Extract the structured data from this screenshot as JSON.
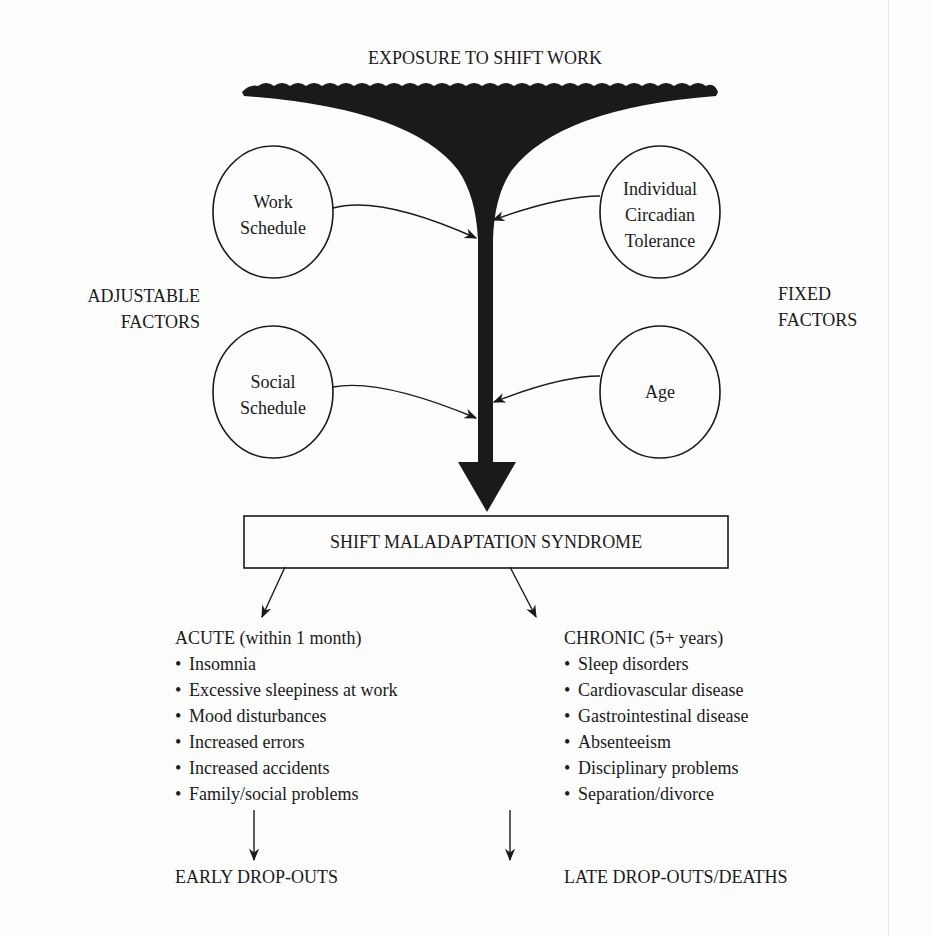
{
  "title": "EXPOSURE TO SHIFT WORK",
  "side_labels": {
    "adjustable": [
      "ADJUSTABLE",
      "FACTORS"
    ],
    "fixed": [
      "FIXED",
      "FACTORS"
    ]
  },
  "factors": {
    "work_schedule": [
      "Work",
      "Schedule"
    ],
    "social_schedule": [
      "Social",
      "Schedule"
    ],
    "circadian_tolerance": [
      "Individual",
      "Circadian",
      "Tolerance"
    ],
    "age": [
      "Age"
    ]
  },
  "syndrome_box": "SHIFT MALADAPTATION SYNDROME",
  "acute": {
    "heading": "ACUTE (within 1 month)",
    "items": [
      "Insomnia",
      "Excessive sleepiness at work",
      "Mood disturbances",
      "Increased errors",
      "Increased accidents",
      "Family/social problems"
    ],
    "outcome": "EARLY DROP-OUTS"
  },
  "chronic": {
    "heading": "CHRONIC (5+ years)",
    "items": [
      "Sleep disorders",
      "Cardiovascular disease",
      "Gastrointestinal disease",
      "Absenteeism",
      "Disciplinary problems",
      "Separation/divorce"
    ],
    "outcome": "LATE DROP-OUTS/DEATHS"
  },
  "colors": {
    "ink": "#1a1a1a",
    "paper": "#fdfdfd"
  }
}
